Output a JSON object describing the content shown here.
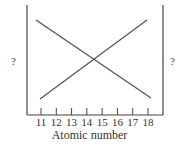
{
  "chart_data": {
    "type": "line",
    "title": "",
    "xlabel": "Atomic number",
    "ylabel_left": "?",
    "ylabel_right": "?",
    "categories": [
      "11",
      "12",
      "13",
      "14",
      "15",
      "16",
      "17",
      "18"
    ],
    "x": [
      11,
      18
    ],
    "series": [
      {
        "name": "decreasing",
        "values": [
          1.0,
          0.0
        ],
        "x": [
          11,
          18
        ]
      },
      {
        "name": "increasing",
        "values": [
          0.0,
          1.0
        ],
        "x": [
          11,
          18
        ]
      }
    ],
    "xlim": [
      10,
      19
    ],
    "grid": false,
    "legend": "none",
    "annotations": [
      "Lines cross near atomic number 14.5"
    ]
  },
  "axes": {
    "xlabel": "Atomic number",
    "ylabel_left": "?",
    "ylabel_right": "?"
  }
}
